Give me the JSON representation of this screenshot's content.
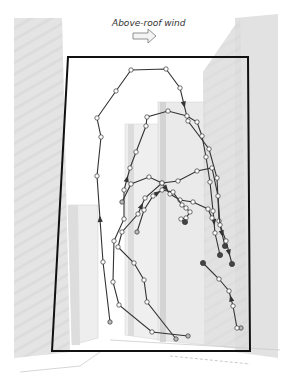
{
  "title": "Above-roof wind",
  "icons": {
    "wind_arrow": "right-arrow-outline"
  },
  "colors": {
    "frame": "#111111",
    "trajectory": "#333333",
    "node_fill": "#ffffff",
    "end_node_fill": "#444444",
    "building_light": "#ececec",
    "building_mid": "#dcdcdc",
    "building_dark": "#cfcfcf"
  },
  "trajectories": [
    {
      "name": "outer-loop",
      "points": [
        [
          110,
          322
        ],
        [
          103,
          262
        ],
        [
          97,
          176
        ],
        [
          101,
          137
        ],
        [
          97,
          118
        ],
        [
          116,
          91
        ],
        [
          131,
          70
        ],
        [
          166,
          69
        ],
        [
          180,
          88
        ],
        [
          188,
          121
        ],
        [
          209,
          149
        ],
        [
          217,
          178
        ],
        [
          219,
          221
        ],
        [
          225,
          246
        ]
      ],
      "end": "filled",
      "arrows": [
        1,
        8,
        12
      ]
    },
    {
      "name": "second-loop",
      "points": [
        [
          188,
          336
        ],
        [
          152,
          332
        ],
        [
          119,
          305
        ],
        [
          113,
          282
        ],
        [
          114,
          241
        ],
        [
          124,
          219
        ],
        [
          124,
          190
        ],
        [
          130,
          168
        ],
        [
          136,
          152
        ],
        [
          146,
          126
        ],
        [
          147,
          117
        ],
        [
          168,
          111
        ],
        [
          187,
          116
        ],
        [
          197,
          122
        ],
        [
          202,
          136
        ],
        [
          206,
          157
        ],
        [
          210,
          182
        ],
        [
          213,
          211
        ],
        [
          215,
          233
        ],
        [
          220,
          255
        ]
      ],
      "end": "filled",
      "arrows": [
        6,
        17
      ]
    },
    {
      "name": "third-loop",
      "points": [
        [
          176,
          339
        ],
        [
          147,
          302
        ],
        [
          144,
          280
        ],
        [
          134,
          263
        ],
        [
          118,
          247
        ],
        [
          122,
          232
        ],
        [
          138,
          214
        ],
        [
          145,
          198
        ],
        [
          162,
          183
        ],
        [
          178,
          181
        ],
        [
          197,
          171
        ],
        [
          212,
          168
        ],
        [
          218,
          196
        ],
        [
          220,
          225
        ],
        [
          226,
          241
        ],
        [
          232,
          264
        ]
      ],
      "end": "filled",
      "arrows": [
        6,
        14
      ]
    },
    {
      "name": "fourth-loop",
      "points": [
        [
          122,
          202
        ],
        [
          131,
          184
        ],
        [
          149,
          177
        ],
        [
          162,
          183
        ],
        [
          170,
          194
        ],
        [
          180,
          200
        ],
        [
          193,
          202
        ],
        [
          208,
          209
        ],
        [
          212,
          218
        ]
      ],
      "end": "open",
      "arrows": [
        3
      ]
    },
    {
      "name": "inner-spiral",
      "points": [
        [
          137,
          232
        ],
        [
          144,
          210
        ],
        [
          153,
          196
        ],
        [
          162,
          190
        ],
        [
          173,
          192
        ],
        [
          182,
          205
        ],
        [
          186,
          208
        ],
        [
          190,
          212
        ],
        [
          186,
          218
        ],
        [
          181,
          219
        ],
        [
          185,
          222
        ]
      ],
      "end": "filled",
      "arrows": [
        2
      ]
    },
    {
      "name": "lower-right",
      "points": [
        [
          241,
          328
        ],
        [
          237,
          328
        ],
        [
          233,
          306
        ],
        [
          229,
          291
        ],
        [
          219,
          279
        ],
        [
          203,
          263
        ]
      ],
      "end": "filled",
      "arrows": [
        2
      ]
    }
  ]
}
